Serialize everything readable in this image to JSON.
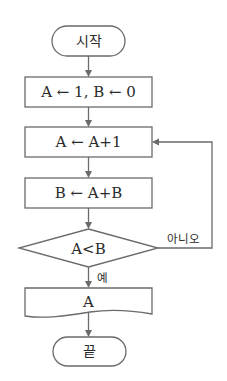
{
  "flowchart": {
    "start": {
      "label": "시작"
    },
    "init": {
      "label": "A ← 1, B ← 0"
    },
    "step_increment": {
      "label": "A ← A+1"
    },
    "step_sum": {
      "label": "B ← A+B"
    },
    "decision": {
      "label": "A<B",
      "yes_label": "예",
      "no_label": "아니오"
    },
    "output": {
      "label": "A"
    },
    "end": {
      "label": "끝"
    }
  },
  "colors": {
    "stroke": "#6a6a6a",
    "text": "#2a2a2a",
    "background": "#ffffff"
  }
}
